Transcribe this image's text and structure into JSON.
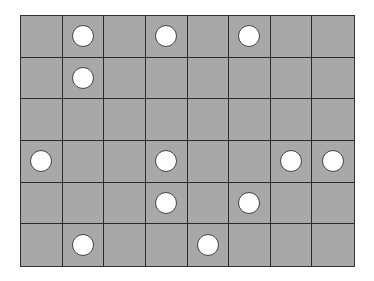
{
  "board": {
    "rows": 6,
    "cols": 8,
    "cell_color": "#a8a8a8",
    "line_color": "#2a2a2a",
    "piece_color": "#ffffff",
    "pieces": [
      {
        "row": 0,
        "col": 1
      },
      {
        "row": 0,
        "col": 3
      },
      {
        "row": 0,
        "col": 5
      },
      {
        "row": 1,
        "col": 1
      },
      {
        "row": 3,
        "col": 0
      },
      {
        "row": 3,
        "col": 3
      },
      {
        "row": 3,
        "col": 6
      },
      {
        "row": 3,
        "col": 7
      },
      {
        "row": 4,
        "col": 3
      },
      {
        "row": 4,
        "col": 5
      },
      {
        "row": 5,
        "col": 1
      },
      {
        "row": 5,
        "col": 4
      }
    ]
  }
}
